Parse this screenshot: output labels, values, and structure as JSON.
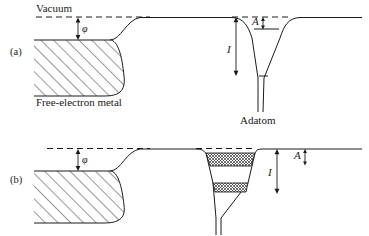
{
  "figure": {
    "background_color": "#ffffff",
    "line_color": "#1a1a1a",
    "width": 369,
    "height": 235
  },
  "labels": {
    "vacuum": "Vacuum",
    "free_electron_metal": "Free-electron metal",
    "adatom": "Adatom",
    "panel_a": "(a)",
    "panel_b": "(b)",
    "phi": "φ",
    "ionization": "I",
    "affinity": "A"
  },
  "panels": [
    {
      "id": "a",
      "label": "(a)",
      "annotations": [
        {
          "name": "vacuum-level",
          "text": "Vacuum",
          "style": "dashed-line"
        },
        {
          "name": "work-function",
          "text": "φ",
          "style": "double-arrow-vertical"
        },
        {
          "name": "ionization-energy",
          "text": "I",
          "style": "double-arrow-vertical"
        },
        {
          "name": "electron-affinity",
          "text": "A",
          "style": "double-arrow-vertical"
        },
        {
          "name": "metal-region",
          "text": "Free-electron metal",
          "style": "diagonal-hatch"
        },
        {
          "name": "adatom-well",
          "text": "Adatom",
          "style": "funnel-well"
        }
      ],
      "adatom_levels": [
        {
          "name": "upper-level",
          "fill": "none"
        },
        {
          "name": "lower-level",
          "fill": "none"
        }
      ]
    },
    {
      "id": "b",
      "label": "(b)",
      "annotations": [
        {
          "name": "vacuum-level",
          "text": "Vacuum",
          "style": "dashed-line"
        },
        {
          "name": "work-function",
          "text": "φ",
          "style": "double-arrow-vertical"
        },
        {
          "name": "ionization-energy",
          "text": "I",
          "style": "double-arrow-vertical"
        },
        {
          "name": "electron-affinity",
          "text": "A",
          "style": "double-arrow-vertical"
        },
        {
          "name": "metal-region",
          "text": "",
          "style": "diagonal-hatch"
        },
        {
          "name": "adatom-well",
          "text": "",
          "style": "funnel-well"
        }
      ],
      "adatom_levels": [
        {
          "name": "upper-broadened-level",
          "fill": "cross-hatch"
        },
        {
          "name": "lower-broadened-level",
          "fill": "cross-hatch"
        }
      ]
    }
  ]
}
